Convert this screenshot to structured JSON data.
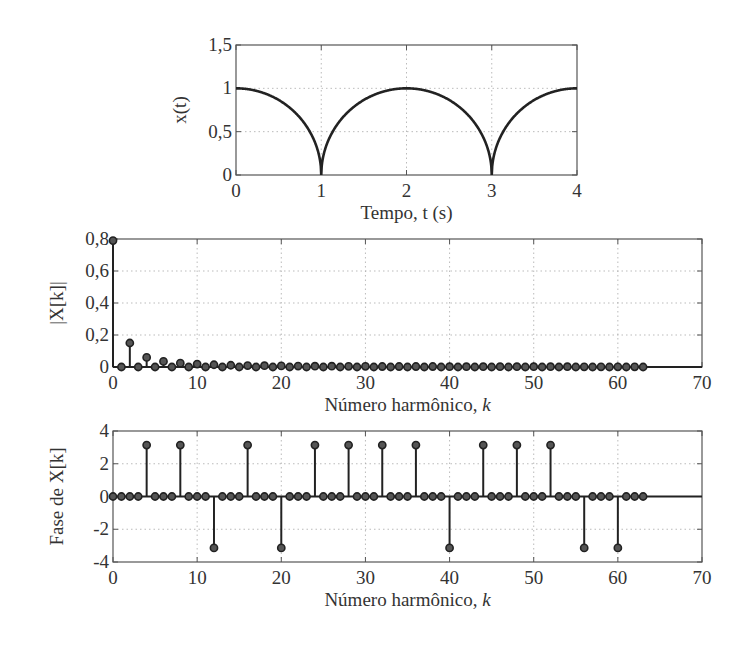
{
  "figure": {
    "colors": {
      "line": "#222222",
      "frame": "#555555",
      "grid": "#aaaaaa",
      "text": "#333333"
    }
  },
  "chart_data": [
    {
      "id": "signal",
      "type": "line",
      "title": "",
      "xlabel": "Tempo, t (s)",
      "ylabel": "x(t)",
      "xlim": [
        0,
        4
      ],
      "ylim": [
        0,
        1.5
      ],
      "xticks": [
        0,
        1,
        2,
        3,
        4
      ],
      "xtick_labels": [
        "0",
        "1",
        "2",
        "3",
        "4"
      ],
      "yticks": [
        0,
        0.5,
        1,
        1.5
      ],
      "ytick_labels": [
        "0",
        "0,5",
        "1",
        "1,5"
      ],
      "grid": true,
      "description": "Periodic semicircular arcs: x(t)=sqrt(1-(t-2n)^2), period 2 s, zeros at t=1 and t=3, peaks of 1 at t=0, 2, 4",
      "x": [
        0,
        0.25,
        0.5,
        0.75,
        0.9,
        1.0,
        1.1,
        1.25,
        1.5,
        1.75,
        2.0,
        2.25,
        2.5,
        2.75,
        2.9,
        3.0,
        3.1,
        3.25,
        3.5,
        3.75,
        4.0
      ],
      "y": [
        1.0,
        0.968,
        0.866,
        0.661,
        0.436,
        0.0,
        0.436,
        0.661,
        0.866,
        0.968,
        1.0,
        0.968,
        0.866,
        0.661,
        0.436,
        0.0,
        0.436,
        0.661,
        0.866,
        0.968,
        1.0
      ]
    },
    {
      "id": "magnitude",
      "type": "stem",
      "title": "",
      "xlabel": "Número harmônico, k",
      "ylabel": "|X[k]|",
      "xlim": [
        0,
        70
      ],
      "ylim": [
        0,
        0.8
      ],
      "xticks": [
        0,
        10,
        20,
        30,
        40,
        50,
        60,
        70
      ],
      "xtick_labels": [
        "0",
        "10",
        "20",
        "30",
        "40",
        "50",
        "60",
        "70"
      ],
      "yticks": [
        0,
        0.2,
        0.4,
        0.6,
        0.8
      ],
      "ytick_labels": [
        "0",
        "0,2",
        "0,4",
        "0,6",
        "0,8"
      ],
      "grid": true,
      "k": [
        0,
        1,
        2,
        3,
        4,
        5,
        6,
        7,
        8,
        9,
        10,
        11,
        12,
        13,
        14,
        15,
        16,
        17,
        18,
        19,
        20,
        21,
        22,
        23,
        24,
        25,
        26,
        27,
        28,
        29,
        30,
        31,
        32,
        33,
        34,
        35,
        36,
        37,
        38,
        39,
        40,
        41,
        42,
        43,
        44,
        45,
        46,
        47,
        48,
        49,
        50,
        51,
        52,
        53,
        54,
        55,
        56,
        57,
        58,
        59,
        60,
        61,
        62,
        63
      ],
      "values": [
        0.79,
        0,
        0.15,
        0,
        0.06,
        0,
        0.035,
        0,
        0.024,
        0,
        0.018,
        0,
        0.014,
        0,
        0.011,
        0,
        0.009,
        0,
        0.008,
        0,
        0.007,
        0,
        0.006,
        0,
        0.005,
        0,
        0.005,
        0,
        0.004,
        0,
        0.004,
        0,
        0.003,
        0,
        0.003,
        0,
        0.003,
        0,
        0.003,
        0,
        0.002,
        0,
        0.002,
        0,
        0.002,
        0,
        0.002,
        0,
        0.002,
        0,
        0.002,
        0,
        0.002,
        0,
        0.002,
        0,
        0.001,
        0,
        0.001,
        0,
        0.001,
        0,
        0.001,
        0
      ]
    },
    {
      "id": "phase",
      "type": "stem",
      "title": "",
      "xlabel": "Número harmônico, k",
      "ylabel": "Fase de X[k]",
      "xlim": [
        0,
        70
      ],
      "ylim": [
        -4,
        4
      ],
      "xticks": [
        0,
        10,
        20,
        30,
        40,
        50,
        60,
        70
      ],
      "xtick_labels": [
        "0",
        "10",
        "20",
        "30",
        "40",
        "50",
        "60",
        "70"
      ],
      "yticks": [
        -4,
        -2,
        0,
        2,
        4
      ],
      "ytick_labels": [
        "-4",
        "-2",
        "0",
        "2",
        "4"
      ],
      "grid": true,
      "k": [
        0,
        1,
        2,
        3,
        4,
        5,
        6,
        7,
        8,
        9,
        10,
        11,
        12,
        13,
        14,
        15,
        16,
        17,
        18,
        19,
        20,
        21,
        22,
        23,
        24,
        25,
        26,
        27,
        28,
        29,
        30,
        31,
        32,
        33,
        34,
        35,
        36,
        37,
        38,
        39,
        40,
        41,
        42,
        43,
        44,
        45,
        46,
        47,
        48,
        49,
        50,
        51,
        52,
        53,
        54,
        55,
        56,
        57,
        58,
        59,
        60,
        61,
        62,
        63
      ],
      "values": [
        0,
        0,
        0,
        0,
        3.14,
        0,
        0,
        0,
        3.14,
        0,
        0,
        0,
        -3.14,
        0,
        0,
        0,
        3.14,
        0,
        0,
        0,
        -3.14,
        0,
        0,
        0,
        3.14,
        0,
        0,
        0,
        3.14,
        0,
        0,
        0,
        3.14,
        0,
        0,
        0,
        3.14,
        0,
        0,
        0,
        -3.14,
        0,
        0,
        0,
        3.14,
        0,
        0,
        0,
        3.14,
        0,
        0,
        0,
        3.14,
        0,
        0,
        0,
        -3.14,
        0,
        0,
        0,
        -3.14,
        0,
        0,
        0
      ]
    }
  ],
  "layout": {
    "signal": {
      "left": 236,
      "top": 45,
      "right": 577,
      "bottom": 175
    },
    "magnitude": {
      "left": 113,
      "top": 239,
      "right": 702,
      "bottom": 367
    },
    "phase": {
      "left": 113,
      "top": 431,
      "right": 702,
      "bottom": 562
    }
  }
}
